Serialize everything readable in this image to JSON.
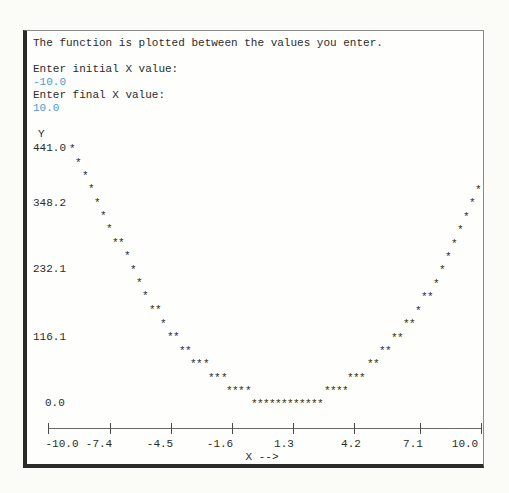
{
  "console": {
    "intro": "The function is plotted between the values you enter.",
    "prompt_initial": "Enter initial X value:",
    "value_initial": "-10.0",
    "prompt_final": "Enter final X value:",
    "value_final": "10.0",
    "input_color": "#4a9ad4"
  },
  "chart_data": {
    "type": "scatter",
    "title": "",
    "xlabel": "X -->",
    "ylabel": "Y",
    "xlim": [
      -10.0,
      10.0
    ],
    "ylim": [
      0.0,
      441.0
    ],
    "grid": false,
    "y_ticks": [
      "441.0",
      "348.2",
      "232.1",
      "116.1",
      "0.0"
    ],
    "x_ticks": [
      "-10.0",
      "-7.4",
      "-4.5",
      "-1.6",
      "1.3",
      "4.2",
      "7.1",
      "10.0"
    ],
    "marker": "*",
    "x": [
      -10.0,
      -9.7,
      -9.4,
      -9.1,
      -8.8,
      -8.5,
      -8.2,
      -7.9,
      -7.6,
      -7.3,
      -7.0,
      -6.7,
      -6.4,
      -6.1,
      -5.8,
      -5.5,
      -5.2,
      -4.9,
      -4.6,
      -4.3,
      -4.0,
      -3.7,
      -3.4,
      -3.1,
      -2.8,
      -2.5,
      -2.2,
      -1.9,
      -1.6,
      -1.3,
      -1.0,
      -0.7,
      -0.4,
      -0.1,
      0.2,
      0.5,
      0.8,
      1.1,
      1.4,
      1.7,
      2.0,
      2.3,
      2.6,
      2.9,
      3.2,
      3.5,
      3.8,
      4.1,
      4.4,
      4.7,
      5.0,
      5.3,
      5.6,
      5.9,
      6.2,
      6.5,
      6.8,
      7.1,
      7.4,
      7.7,
      8.0,
      8.3,
      8.6,
      8.9,
      9.2,
      9.5,
      9.8,
      10.0
    ],
    "values": [
      441.0,
      427,
      414,
      400,
      386,
      372,
      359,
      345,
      345,
      331,
      317,
      304,
      290,
      276,
      262,
      262,
      248,
      235,
      235,
      221,
      221,
      207,
      207,
      207,
      193,
      193,
      193,
      180,
      180,
      180,
      180,
      166,
      166,
      166,
      166,
      166,
      166,
      166,
      166,
      166,
      166,
      166,
      166,
      180,
      180,
      180,
      180,
      193,
      193,
      193,
      207,
      207,
      221,
      221,
      235,
      235,
      248,
      248,
      262,
      276,
      276,
      290,
      304,
      317,
      331,
      345,
      359,
      372
    ]
  },
  "plot": {
    "stars": [
      [
        72,
        148
      ],
      [
        78,
        162
      ],
      [
        85,
        175
      ],
      [
        91,
        188
      ],
      [
        97,
        202
      ],
      [
        103,
        215
      ],
      [
        109,
        228
      ],
      [
        115,
        242
      ],
      [
        121,
        242
      ],
      [
        127,
        255
      ],
      [
        133,
        269
      ],
      [
        139,
        282
      ],
      [
        145,
        295
      ],
      [
        152,
        309
      ],
      [
        158,
        309
      ],
      [
        163,
        323
      ],
      [
        170,
        336
      ],
      [
        176,
        336
      ],
      [
        182,
        350
      ],
      [
        188,
        350
      ],
      [
        193,
        363
      ],
      [
        199,
        363
      ],
      [
        206,
        363
      ],
      [
        211,
        377
      ],
      [
        217,
        377
      ],
      [
        224,
        377
      ],
      [
        229,
        390
      ],
      [
        235,
        390
      ],
      [
        241,
        390
      ],
      [
        248,
        390
      ],
      [
        254,
        403
      ],
      [
        260,
        403
      ],
      [
        266,
        403
      ],
      [
        272,
        403
      ],
      [
        278,
        403
      ],
      [
        284,
        403
      ],
      [
        290,
        403
      ],
      [
        296,
        403
      ],
      [
        302,
        403
      ],
      [
        308,
        403
      ],
      [
        314,
        403
      ],
      [
        320,
        403
      ],
      [
        327,
        390
      ],
      [
        333,
        390
      ],
      [
        339,
        390
      ],
      [
        345,
        390
      ],
      [
        350,
        377
      ],
      [
        356,
        377
      ],
      [
        362,
        377
      ],
      [
        370,
        363
      ],
      [
        376,
        363
      ],
      [
        382,
        350
      ],
      [
        388,
        350
      ],
      [
        394,
        337
      ],
      [
        400,
        337
      ],
      [
        406,
        323
      ],
      [
        412,
        323
      ],
      [
        418,
        310
      ],
      [
        424,
        296
      ],
      [
        430,
        296
      ],
      [
        436,
        283
      ],
      [
        442,
        269
      ],
      [
        448,
        256
      ],
      [
        454,
        243
      ],
      [
        460,
        229
      ],
      [
        466,
        216
      ],
      [
        472,
        202
      ],
      [
        478,
        189
      ]
    ],
    "y_label_positions": [
      148,
      203,
      269,
      337,
      403
    ],
    "x_tick_positions": [
      48,
      110,
      171,
      232,
      293,
      354,
      420,
      481
    ],
    "x_label_positions": [
      42,
      104,
      166,
      227,
      289,
      350,
      413,
      466
    ]
  }
}
